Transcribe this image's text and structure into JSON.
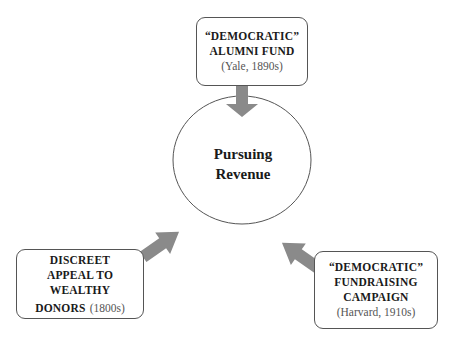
{
  "center": {
    "line1": "Pursuing",
    "line2": "Revenue"
  },
  "top_box": {
    "line1": "“DEMOCRATIC”",
    "line2": "ALUMNI FUND",
    "line3": "(Yale, 1890s)"
  },
  "left_box": {
    "line1": "DISCREET",
    "line2": "APPEAL TO",
    "line3": "WEALTHY",
    "line4": "DONORS",
    "line4_suffix": "(1800s)"
  },
  "right_box": {
    "line1": "“DEMOCRATIC”",
    "line2": "FUNDRAISING",
    "line3": "CAMPAIGN",
    "line4": "(Harvard, 1910s)"
  },
  "colors": {
    "arrow": "#8a8a8a",
    "border": "#555555"
  }
}
